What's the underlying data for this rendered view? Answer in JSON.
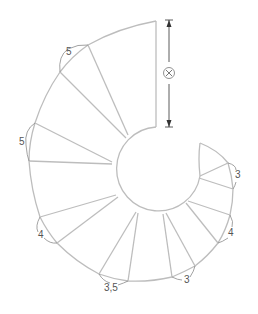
{
  "diagram": {
    "dimension_symbol": "⊗",
    "labels": [
      {
        "id": "top-left",
        "text": "5",
        "x": 66,
        "y": 55
      },
      {
        "id": "left",
        "text": "5",
        "x": 19,
        "y": 145
      },
      {
        "id": "lower-left",
        "text": "4",
        "x": 38,
        "y": 238
      },
      {
        "id": "bottom",
        "text": "3,5",
        "x": 104,
        "y": 291
      },
      {
        "id": "bottom-right",
        "text": "3",
        "x": 184,
        "y": 283
      },
      {
        "id": "right",
        "text": "4",
        "x": 228,
        "y": 236
      },
      {
        "id": "upper-right",
        "text": "3",
        "x": 235,
        "y": 178
      }
    ],
    "colors": {
      "line": "#bdbdbd",
      "label": "#555555",
      "dimension": "#333333"
    }
  }
}
